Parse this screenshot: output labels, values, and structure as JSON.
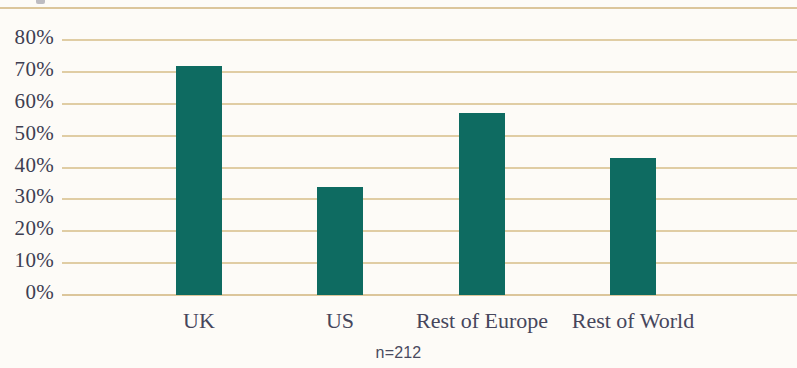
{
  "chart_data": {
    "type": "bar",
    "title": "",
    "subtitle": "",
    "xlabel": "",
    "ylabel": "",
    "categories": [
      "UK",
      "US",
      "Rest of Europe",
      "Rest of World"
    ],
    "values": [
      72,
      34,
      57,
      43
    ],
    "series": [
      {
        "name": "",
        "values": [
          72,
          34,
          57,
          43
        ]
      }
    ],
    "ylim": [
      0,
      80
    ],
    "ytick_labels": [
      "80%",
      "70%",
      "60%",
      "50%",
      "40%",
      "30%",
      "20%",
      "10%",
      "0%"
    ],
    "ytick_values": [
      80,
      70,
      60,
      50,
      40,
      30,
      20,
      10,
      0
    ],
    "grid": true,
    "legend": "none",
    "annotation": "n=212",
    "colors": {
      "bar": "#0e6b61",
      "gridline": "#e0cda4",
      "rule": "#dcc69b",
      "text": "#3e3e52",
      "background": "#fdfbf7"
    }
  },
  "axis": {
    "y": {
      "ticks": [
        {
          "label": "80%",
          "value": 80
        },
        {
          "label": "70%",
          "value": 70
        },
        {
          "label": "60%",
          "value": 60
        },
        {
          "label": "50%",
          "value": 50
        },
        {
          "label": "40%",
          "value": 40
        },
        {
          "label": "30%",
          "value": 30
        },
        {
          "label": "20%",
          "value": 20
        },
        {
          "label": "10%",
          "value": 10
        },
        {
          "label": "0%",
          "value": 0
        }
      ]
    },
    "x": {
      "categories": [
        {
          "label": "UK",
          "value": 72
        },
        {
          "label": "US",
          "value": 34
        },
        {
          "label": "Rest of Europe",
          "value": 57
        },
        {
          "label": "Rest of World",
          "value": 43
        }
      ]
    }
  },
  "footnote": {
    "text": "n=212"
  }
}
